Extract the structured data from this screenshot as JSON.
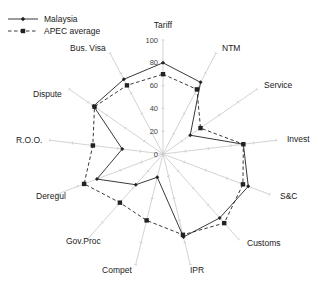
{
  "chart_data": {
    "type": "radar",
    "title": "",
    "categories": [
      "Tariff",
      "NTM",
      "Service",
      "Invest",
      "S&C",
      "Customs",
      "IPR",
      "Compet",
      "Gov.Proc",
      "Deregul",
      "R.O.O.",
      "Dispute",
      "Bus. Visa"
    ],
    "series": [
      {
        "name": "Malaysia",
        "marker": "diamond",
        "line": "solid",
        "values": [
          80,
          71,
          29,
          71,
          80,
          75,
          75,
          21,
          36,
          62,
          36,
          74,
          74
        ]
      },
      {
        "name": "APEC average",
        "marker": "square",
        "line": "dashed",
        "values": [
          70,
          64,
          40,
          71,
          75,
          81,
          73,
          60,
          57,
          74,
          62,
          73,
          68
        ]
      }
    ],
    "radial_ticks": [
      "0",
      "20",
      "40",
      "60",
      "80",
      "100"
    ],
    "rlim": [
      0,
      100
    ],
    "grid": false,
    "legend_position": "top-left",
    "colors": {
      "line": "#222222",
      "axis": "#c8c8c8"
    }
  },
  "legend": {
    "items": [
      {
        "label": "Malaysia"
      },
      {
        "label": "APEC average"
      }
    ]
  }
}
